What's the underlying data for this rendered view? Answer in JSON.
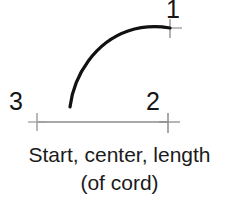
{
  "figure": {
    "background_color": "#ffffff",
    "arc": {
      "name": "construction-arc",
      "color": "#111111",
      "stroke_width": 3.2,
      "start_point": {
        "x": 70,
        "y": 107
      },
      "end_point": {
        "x": 170,
        "y": 28
      },
      "description": "arc curving from lower-left start up to the right end point"
    },
    "baseline": {
      "name": "cord-baseline",
      "color": "#8d8d8d",
      "stroke_width": 1.4,
      "from": {
        "x": 37,
        "y": 122
      },
      "to": {
        "x": 168,
        "y": 122
      }
    },
    "tick_marks": [
      {
        "name": "tick-point-1",
        "x": 170,
        "y": 28,
        "color": "#9a9a9a",
        "size": 9
      },
      {
        "name": "tick-point-2",
        "x": 168,
        "y": 122,
        "color": "#8d8d8d",
        "size": 11
      },
      {
        "name": "tick-point-3",
        "x": 37,
        "y": 122,
        "color": "#a0a0a0",
        "size": 11
      }
    ],
    "point_labels": [
      {
        "id": "1",
        "text": "1"
      },
      {
        "id": "2",
        "text": "2"
      },
      {
        "id": "3",
        "text": "3"
      }
    ],
    "caption": {
      "line1": "Start, center, length",
      "line2": "(of cord)"
    }
  }
}
